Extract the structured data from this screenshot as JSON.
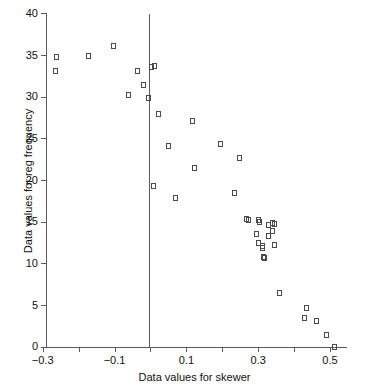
{
  "chart_data": {
    "type": "scatter",
    "title": "",
    "xlabel": "Data values for skewer",
    "ylabel": "Data values for reg frequency",
    "xlim": [
      -0.3,
      0.56
    ],
    "ylim": [
      0,
      40
    ],
    "grid": false,
    "legend": null,
    "annotations": [
      {
        "type": "vertical-reference-line",
        "x": 0.0
      }
    ],
    "xticks": [
      -0.3,
      -0.2,
      -0.1,
      0.0,
      0.1,
      0.2,
      0.3,
      0.4,
      0.5
    ],
    "xtick_labels": [
      "-0.3",
      "",
      "-0.1",
      "",
      "0.1",
      "",
      "0.3",
      "",
      "0.5"
    ],
    "yticks": [
      0,
      5,
      10,
      15,
      20,
      25,
      30,
      35,
      40
    ],
    "ytick_labels": [
      "0",
      "5",
      "10",
      "15",
      "20",
      "25",
      "30",
      "35",
      "40"
    ],
    "marker": "open-square",
    "marker_color": "#4a4a4a",
    "points": [
      {
        "x": -0.262,
        "y": 34.8
      },
      {
        "x": -0.265,
        "y": 33.1
      },
      {
        "x": -0.172,
        "y": 34.9
      },
      {
        "x": -0.102,
        "y": 36.1
      },
      {
        "x": -0.06,
        "y": 30.2
      },
      {
        "x": -0.035,
        "y": 33.1
      },
      {
        "x": -0.02,
        "y": 31.4
      },
      {
        "x": -0.006,
        "y": 29.8
      },
      {
        "x": 0.004,
        "y": 33.6
      },
      {
        "x": 0.012,
        "y": 33.7
      },
      {
        "x": 0.022,
        "y": 27.9
      },
      {
        "x": 0.007,
        "y": 19.3
      },
      {
        "x": 0.05,
        "y": 24.1
      },
      {
        "x": 0.07,
        "y": 17.8
      },
      {
        "x": 0.118,
        "y": 27.1
      },
      {
        "x": 0.122,
        "y": 21.5
      },
      {
        "x": 0.196,
        "y": 24.3
      },
      {
        "x": 0.234,
        "y": 18.5
      },
      {
        "x": 0.248,
        "y": 22.6
      },
      {
        "x": 0.268,
        "y": 15.3
      },
      {
        "x": 0.272,
        "y": 15.2
      },
      {
        "x": 0.296,
        "y": 13.5
      },
      {
        "x": 0.3,
        "y": 15.2
      },
      {
        "x": 0.303,
        "y": 15.0
      },
      {
        "x": 0.302,
        "y": 12.5
      },
      {
        "x": 0.312,
        "y": 11.9
      },
      {
        "x": 0.313,
        "y": 12.1
      },
      {
        "x": 0.316,
        "y": 10.8
      },
      {
        "x": 0.317,
        "y": 10.6
      },
      {
        "x": 0.328,
        "y": 14.6
      },
      {
        "x": 0.33,
        "y": 13.3
      },
      {
        "x": 0.341,
        "y": 14.8
      },
      {
        "x": 0.346,
        "y": 14.7
      },
      {
        "x": 0.34,
        "y": 13.9
      },
      {
        "x": 0.344,
        "y": 12.2
      },
      {
        "x": 0.36,
        "y": 6.4
      },
      {
        "x": 0.435,
        "y": 4.7
      },
      {
        "x": 0.43,
        "y": 3.4
      },
      {
        "x": 0.462,
        "y": 3.1
      },
      {
        "x": 0.49,
        "y": 1.4
      },
      {
        "x": 0.512,
        "y": 0.0
      }
    ]
  },
  "axes": {
    "y_title": "Data values for reg frequency",
    "x_title": "Data values for skewer"
  }
}
